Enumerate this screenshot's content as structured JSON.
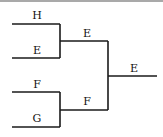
{
  "diagram": {
    "type": "tournament-bracket",
    "round1": [
      {
        "label": "H"
      },
      {
        "label": "E"
      },
      {
        "label": "F"
      },
      {
        "label": "G"
      }
    ],
    "round2": [
      {
        "label": "E"
      },
      {
        "label": "F"
      }
    ],
    "final": {
      "label": "E"
    },
    "line_color": "#1a1a1a"
  }
}
